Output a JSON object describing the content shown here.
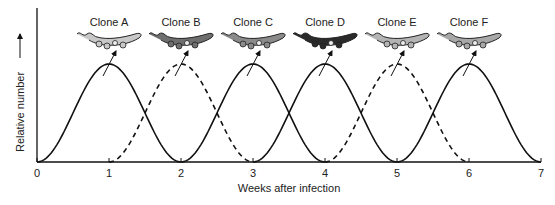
{
  "chart_data": {
    "type": "line",
    "title": "",
    "xlabel": "Weeks after infection",
    "ylabel": "Relative number",
    "xlim": [
      0,
      7
    ],
    "x_ticks": [
      "0",
      "1",
      "2",
      "3",
      "4",
      "5",
      "6",
      "7"
    ],
    "grid": false,
    "series": [
      {
        "name": "Clone A",
        "peak_week": 1,
        "range": [
          0,
          2
        ],
        "style": "solid",
        "color_shade": "#c8c8c8"
      },
      {
        "name": "Clone B",
        "peak_week": 2,
        "range": [
          1,
          3
        ],
        "style": "dashed",
        "color_shade": "#6e6e6e"
      },
      {
        "name": "Clone C",
        "peak_week": 3,
        "range": [
          2,
          4
        ],
        "style": "solid",
        "color_shade": "#8a8a8a"
      },
      {
        "name": "Clone D",
        "peak_week": 4,
        "range": [
          3,
          5
        ],
        "style": "solid",
        "color_shade": "#2a2a2a"
      },
      {
        "name": "Clone E",
        "peak_week": 5,
        "range": [
          4,
          6
        ],
        "style": "dashed",
        "color_shade": "#b4b4b4"
      },
      {
        "name": "Clone F",
        "peak_week": 6,
        "range": [
          5,
          7
        ],
        "style": "solid",
        "color_shade": "#a8a8a8"
      }
    ]
  },
  "labels": {
    "clones": [
      "Clone A",
      "Clone B",
      "Clone C",
      "Clone D",
      "Clone E",
      "Clone F"
    ],
    "xlabel": "Weeks after infection",
    "ylabel": "Relative number",
    "ticks": [
      "0",
      "1",
      "2",
      "3",
      "4",
      "5",
      "6",
      "7"
    ]
  }
}
